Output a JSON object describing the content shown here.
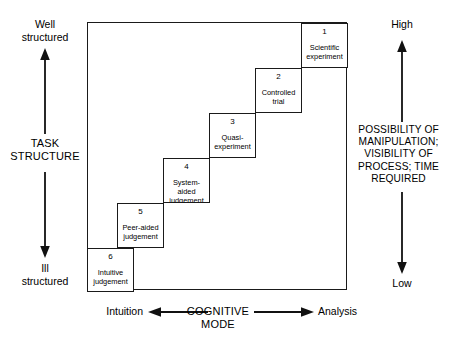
{
  "diagram": {
    "title_hidden": "",
    "y_axis": {
      "top_label": "Well\nstructured",
      "title": "TASK\nSTRUCTURE",
      "bottom_label": "Ill\nstructured"
    },
    "right_axis": {
      "top_label": "High",
      "title": "POSSIBILITY OF\nMANIPULATION;\nVISIBILITY OF\nPROCESS; TIME\nREQUIRED",
      "bottom_label": "Low"
    },
    "x_axis": {
      "left_label": "Intuition",
      "title": "COGNITIVE\nMODE",
      "right_label": "Analysis"
    },
    "steps": [
      {
        "number": "1",
        "label": "Scientific\nexperiment"
      },
      {
        "number": "2",
        "label": "Controlled\ntrial"
      },
      {
        "number": "3",
        "label": "Quasi-\nexperiment"
      },
      {
        "number": "4",
        "label": "System-\naided\njudgement"
      },
      {
        "number": "5",
        "label": "Peer-aided\njudgement"
      },
      {
        "number": "6",
        "label": "Intuitive\njudgement"
      }
    ]
  }
}
